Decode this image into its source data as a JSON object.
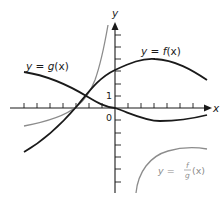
{
  "diagram": {
    "type": "function-graph",
    "axes": {
      "x_label": "x",
      "y_label": "y",
      "origin_label": "0",
      "unit_label": "1"
    },
    "curves": [
      {
        "id": "f",
        "label": "y = f(x)",
        "label_prefix": "y = ",
        "label_func": "f",
        "label_arg": "(x)",
        "color": "#1a1a1a"
      },
      {
        "id": "g",
        "label": "y = g(x)",
        "label_prefix": "y = ",
        "label_func": "g",
        "label_arg": "(x)",
        "color": "#1a1a1a"
      },
      {
        "id": "f_over_g",
        "label": "y = f/g(x)",
        "label_prefix": "y = ",
        "numerator": "f",
        "denominator": "g",
        "label_arg": "(x)",
        "color": "#8c8c8c"
      }
    ]
  }
}
